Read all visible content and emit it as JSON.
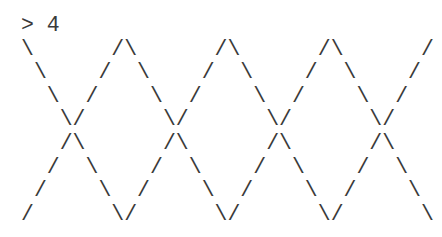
{
  "terminal": {
    "prompt_line": "> 4",
    "output_lines": [
      "\\      /\\      /\\      /\\      /",
      " \\    /  \\    /  \\    /  \\    /",
      "  \\  /    \\  /    \\  /    \\  /",
      "   \\/      \\/      \\/      \\/",
      "   /\\      /\\      /\\      /\\",
      "  /  \\    /  \\    /  \\    /  \\",
      " /    \\  /    \\  /    \\  /    \\",
      "/      \\/      \\/      \\/      \\"
    ]
  }
}
